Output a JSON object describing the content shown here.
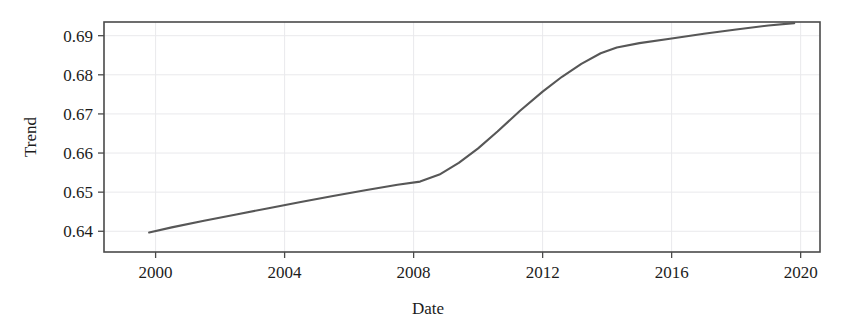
{
  "chart_data": {
    "type": "line",
    "title": "",
    "subtitle": "",
    "xlabel": "Date",
    "ylabel": "Trend",
    "xlim": [
      1998.4,
      2020.6
    ],
    "ylim": [
      0.6347,
      0.6935
    ],
    "xticks": [
      "2000",
      "2004",
      "2008",
      "2012",
      "2016",
      "2020"
    ],
    "xtick_values": [
      2000,
      2004,
      2008,
      2012,
      2016,
      2020
    ],
    "yticks": [
      "0.64",
      "0.65",
      "0.66",
      "0.67",
      "0.68",
      "0.69"
    ],
    "ytick_values": [
      0.64,
      0.65,
      0.66,
      0.67,
      0.68,
      0.69
    ],
    "grid": true,
    "grid_color": "#e9e9ec",
    "legend": false,
    "legend_position": "none",
    "series": [
      {
        "name": "Trend",
        "color": "#575757",
        "x": [
          1999.8,
          2000.5,
          2001.5,
          2002.5,
          2003.5,
          2004.5,
          2005.5,
          2006.5,
          2007.5,
          2008.2,
          2008.8,
          2009.4,
          2010.0,
          2010.6,
          2011.3,
          2012.0,
          2012.6,
          2013.2,
          2013.8,
          2014.3,
          2015.0,
          2016.0,
          2017.0,
          2018.0,
          2019.0,
          2019.8
        ],
        "y": [
          0.6397,
          0.641,
          0.6427,
          0.6443,
          0.6459,
          0.6475,
          0.649,
          0.6505,
          0.6519,
          0.6527,
          0.6545,
          0.6575,
          0.6612,
          0.6655,
          0.6708,
          0.6757,
          0.6795,
          0.6828,
          0.6855,
          0.687,
          0.6881,
          0.6893,
          0.6905,
          0.6916,
          0.6926,
          0.6932
        ]
      }
    ]
  }
}
